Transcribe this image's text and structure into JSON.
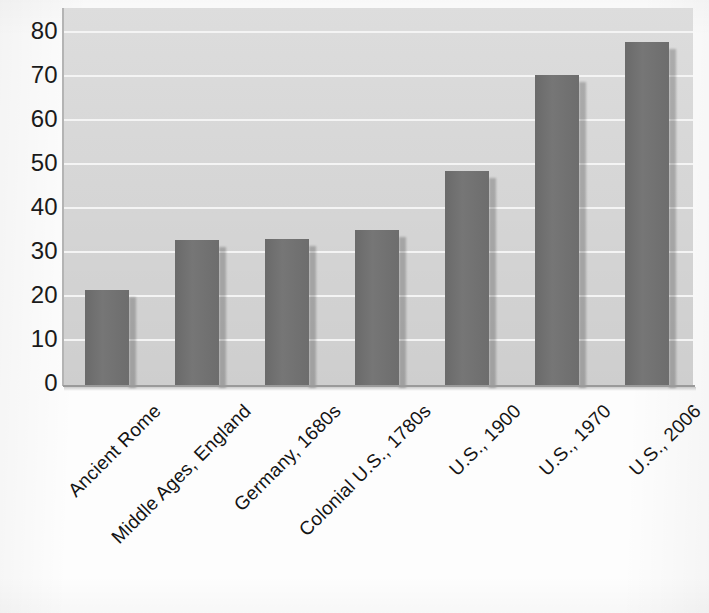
{
  "chart_data": {
    "type": "bar",
    "title": "",
    "subtitle": "",
    "xlabel": "",
    "ylabel": "",
    "categories": [
      "Ancient Rome",
      "Middle Ages, England",
      "Germany, 1680s",
      "Colonial U.S., 1780s",
      "U.S., 1900",
      "U.S., 1970",
      "U.S., 2006"
    ],
    "values": [
      21.5,
      32.7,
      33,
      35,
      48.4,
      70,
      77.5
    ],
    "ylim": [
      0,
      80
    ],
    "ytick_labels": [
      "0",
      "10",
      "20",
      "30",
      "40",
      "50",
      "60",
      "70",
      "80"
    ],
    "ytick_values": [
      0,
      10,
      20,
      30,
      40,
      50,
      60,
      70,
      80
    ],
    "grid": true,
    "grid_axis": "y",
    "legend": false,
    "legend_position": "none",
    "series": [
      {
        "name": "Life expectancy",
        "values": [
          21.5,
          32.7,
          33,
          35,
          48.4,
          70,
          77.5
        ]
      }
    ],
    "colors": {
      "bar": "#6e6e6e",
      "plot_background": "#d9d9d9",
      "gridline": "#f4f4f4",
      "axis": "#9a9a9a",
      "text": "#141414",
      "page_background": "#fdfdfd"
    }
  }
}
